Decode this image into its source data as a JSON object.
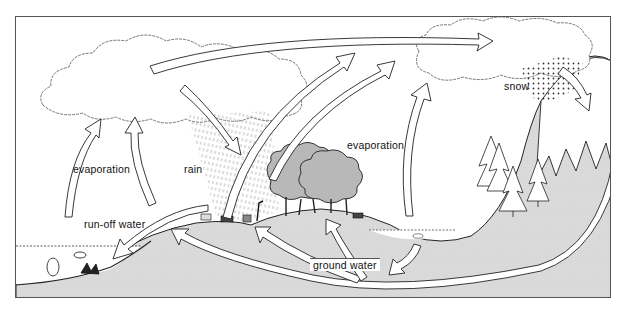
{
  "caption_fragment": "",
  "diagram": {
    "title": "",
    "type": "water cycle illustration",
    "labels": {
      "evaporation_left": "evaporation",
      "evaporation_right": "evaporation",
      "rain": "rain",
      "runoff": "run-off water",
      "snow": "snow",
      "ground_water": "ground water"
    },
    "colors": {
      "land": "#d9d9d9",
      "tree": "#b8b8b8",
      "outline": "#222222",
      "background": "#ffffff"
    },
    "elements": [
      "large cloud (left)",
      "small cloud (right)",
      "rain shading",
      "snow dots",
      "mountain with pine trees",
      "hills with trees and animals",
      "lake with fish",
      "sea with fish and coral",
      "flow arrows"
    ]
  }
}
